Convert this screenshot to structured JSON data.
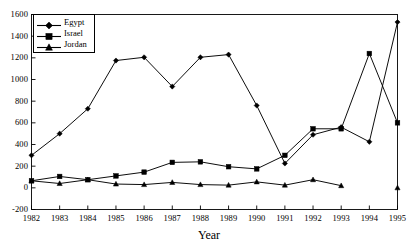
{
  "chart_data": {
    "type": "line",
    "title": "",
    "xlabel": "Year",
    "ylabel": "",
    "grid": false,
    "legend_position": "top-left",
    "x": [
      1982,
      1983,
      1984,
      1985,
      1986,
      1987,
      1988,
      1989,
      1990,
      1991,
      1992,
      1993,
      1994,
      1995
    ],
    "categories": [
      "1982",
      "1983",
      "1984",
      "1985",
      "1986",
      "1987",
      "1988",
      "1989",
      "1990",
      "1991",
      "1992",
      "1993",
      "1994",
      "1995"
    ],
    "xlim": [
      1982,
      1995
    ],
    "ylim": [
      -200,
      1600
    ],
    "yticks": [
      1600,
      1400,
      1200,
      1000,
      800,
      600,
      400,
      200,
      0,
      -200
    ],
    "ytick_labels": [
      "1600",
      "1400",
      "1200",
      "1000",
      "800",
      "600",
      "400",
      "200",
      "0",
      "-200"
    ],
    "xtick_labels": [
      "1982",
      "1983",
      "1984",
      "1985",
      "1986",
      "1987",
      "1988",
      "1989",
      "1990",
      "1991",
      "1992",
      "1993",
      "1994",
      "1995"
    ],
    "series": [
      {
        "name": "Egypt",
        "marker": "diamond",
        "color": "#000000",
        "values": [
          300,
          500,
          730,
          1175,
          1205,
          935,
          1205,
          1230,
          760,
          225,
          490,
          560,
          425,
          1530
        ]
      },
      {
        "name": "Israel",
        "marker": "square",
        "color": "#000000",
        "values": [
          65,
          105,
          75,
          110,
          145,
          235,
          240,
          195,
          175,
          300,
          545,
          545,
          1240,
          600
        ]
      },
      {
        "name": "Jordan",
        "marker": "triangle",
        "color": "#000000",
        "values": [
          65,
          40,
          75,
          35,
          30,
          50,
          30,
          25,
          55,
          25,
          75,
          20,
          null,
          0
        ]
      }
    ]
  },
  "legend": {
    "items": [
      {
        "label": "Egypt",
        "marker": "diamond"
      },
      {
        "label": "Israel",
        "marker": "square"
      },
      {
        "label": "Jordan",
        "marker": "triangle"
      }
    ]
  },
  "axis": {
    "x_title": "Year"
  }
}
